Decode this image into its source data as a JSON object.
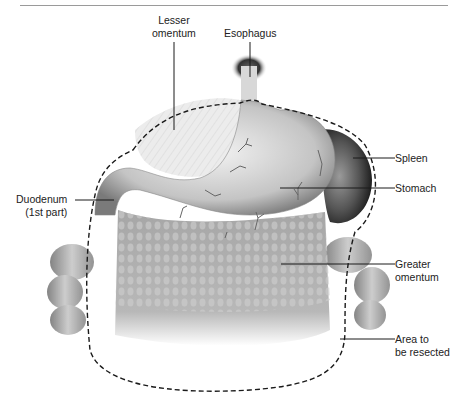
{
  "figure": {
    "labels": {
      "lesser_omentum": [
        "Lesser",
        "omentum"
      ],
      "esophagus": [
        "Esophagus"
      ],
      "duodenum": [
        "Duodenum",
        "(1st part)"
      ],
      "spleen": [
        "Spleen"
      ],
      "stomach": [
        "Stomach"
      ],
      "greater_omentum": [
        "Greater",
        "omentum"
      ],
      "area_resected": [
        "Area to",
        "be resected"
      ]
    },
    "colors": {
      "line": "#1a1a1a",
      "text": "#222222",
      "organ_light": "#e6e6e6",
      "organ_mid": "#b5b5b5",
      "organ_dark": "#555555",
      "omentum": "#a8a8a8"
    }
  }
}
